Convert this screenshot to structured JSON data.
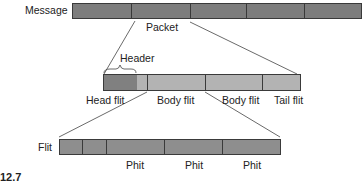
{
  "message": {
    "label": "Message",
    "segments": 5,
    "color": "#7d7d7d"
  },
  "packet": {
    "label": "Packet",
    "header_label": "Header",
    "flit_labels": [
      "Head flit",
      "Body flit",
      "Body flit",
      "Tail flit"
    ],
    "head_color": "#808080",
    "body_color": "#b3b3b3"
  },
  "flit": {
    "label": "Flit",
    "phit_labels": [
      "Phit",
      "Phit",
      "Phit"
    ],
    "color": "#8e8e8e"
  },
  "caption": "12.7"
}
